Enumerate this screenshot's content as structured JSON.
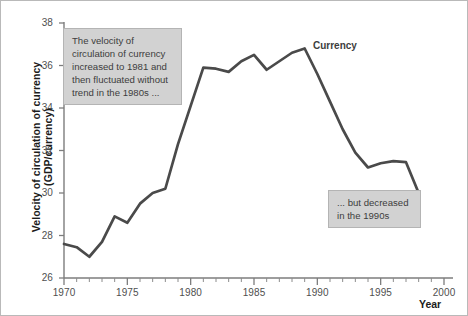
{
  "chart_data": {
    "type": "line",
    "title": "",
    "xlabel": "Year",
    "ylabel": "Velocity of circulation of currency (GDP/currency)",
    "xlim": [
      1970,
      2000
    ],
    "ylim": [
      26,
      38
    ],
    "grid": false,
    "legend_position": "inline-label",
    "x_ticks": [
      1970,
      1975,
      1980,
      1985,
      1990,
      1995,
      2000
    ],
    "x_tick_labels": [
      "1970",
      "1975",
      "1980",
      "1985",
      "1990",
      "1995",
      "2000"
    ],
    "x_minor_tick_step": 1,
    "y_ticks": [
      26,
      28,
      30,
      32,
      34,
      36,
      38
    ],
    "y_tick_labels": [
      "26",
      "28",
      "30",
      "32",
      "34",
      "36",
      "38"
    ],
    "series": [
      {
        "name": "Currency",
        "color": "#4a4a4a",
        "x": [
          1970,
          1971,
          1972,
          1973,
          1974,
          1975,
          1976,
          1977,
          1978,
          1979,
          1980,
          1981,
          1982,
          1983,
          1984,
          1985,
          1986,
          1987,
          1988,
          1989,
          1990,
          1991,
          1992,
          1993,
          1994,
          1995,
          1996,
          1997,
          1998
        ],
        "values": [
          27.6,
          27.45,
          27.0,
          27.7,
          28.9,
          28.6,
          29.5,
          30.0,
          30.2,
          32.3,
          34.1,
          35.9,
          35.85,
          35.7,
          36.2,
          36.5,
          35.8,
          36.2,
          36.6,
          36.8,
          35.6,
          34.3,
          33.0,
          31.9,
          31.2,
          31.4,
          31.5,
          31.45,
          30.0
        ]
      }
    ],
    "annotations": [
      {
        "name": "annotation-increase",
        "text": "The velocity of circulation of currency increased to 1981 and then fluctuated without trend in the 1980s ..."
      },
      {
        "name": "annotation-decrease",
        "text": "... but decreased in the 1990s"
      }
    ],
    "series_labels": [
      {
        "name": "currency-label",
        "text": "Currency"
      }
    ],
    "colors": {
      "line": "#4a4a4a",
      "axis": "#7d7d7d",
      "annotation_background": "#d2d2d2",
      "annotation_border": "#b4b4b4",
      "annotation_text": "#3d3d3d",
      "tick_label": "#4f4f4f",
      "axis_title": "#1c1c1c",
      "figure_background": "#ffffff"
    }
  }
}
